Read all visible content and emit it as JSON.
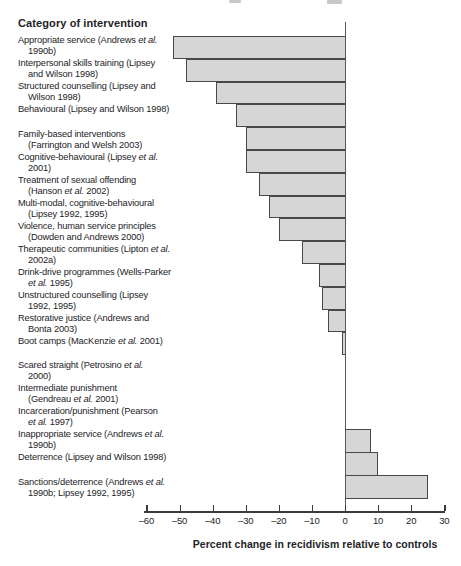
{
  "chart_data": {
    "type": "bar",
    "orientation": "horizontal",
    "title": "Category of intervention",
    "xlabel": "Percent change in recidivism relative to controls",
    "xlim": [
      -60,
      30
    ],
    "x_ticks": [
      -60,
      -50,
      -40,
      -30,
      -20,
      -10,
      0,
      10,
      20,
      30
    ],
    "x_tick_labels": [
      "–60",
      "–50",
      "–40",
      "–30",
      "–20",
      "–10",
      "0",
      "10",
      "20",
      "30"
    ],
    "bar_fill": "#d6d6d6",
    "bar_border": "#47474c",
    "items": [
      {
        "label": "Appropriate service (Andrews et al. 1990b)",
        "label_lines": [
          "Appropriate service (Andrews et al.",
          "1990b)"
        ],
        "value": -52,
        "group": 1,
        "gap_after": false
      },
      {
        "label": "Interpersonal skills training (Lipsey and Wilson 1998)",
        "label_lines": [
          "Interpersonal skills training (Lipsey",
          "and Wilson 1998)"
        ],
        "value": -48,
        "group": 1,
        "gap_after": false
      },
      {
        "label": "Structured counselling (Lipsey and Wilson 1998)",
        "label_lines": [
          "Structured counselling (Lipsey and",
          "Wilson 1998)"
        ],
        "value": -39,
        "group": 1,
        "gap_after": false
      },
      {
        "label": "Behavioural (Lipsey and Wilson 1998)",
        "label_lines": [
          "Behavioural (Lipsey and Wilson 1998)"
        ],
        "value": -33,
        "group": 1,
        "gap_after": true
      },
      {
        "label": "Family-based interventions (Farrington and Welsh 2003)",
        "label_lines": [
          "Family-based interventions",
          "(Farrington and Welsh 2003)"
        ],
        "value": -30,
        "group": 1,
        "gap_after": false
      },
      {
        "label": "Cognitive-behavioural (Lipsey et al. 2001)",
        "label_lines": [
          "Cognitive-behavioural (Lipsey et al.",
          "2001)"
        ],
        "value": -30,
        "group": 1,
        "gap_after": false
      },
      {
        "label": "Treatment of sexual offending (Hanson et al. 2002)",
        "label_lines": [
          "Treatment of sexual offending",
          "(Hanson et al. 2002)"
        ],
        "value": -26,
        "group": 1,
        "gap_after": false
      },
      {
        "label": "Multi-modal, cognitive-behavioural (Lipsey 1992, 1995)",
        "label_lines": [
          "Multi-modal, cognitive-behavioural",
          "(Lipsey 1992, 1995)"
        ],
        "value": -23,
        "group": 1,
        "gap_after": false
      },
      {
        "label": "Violence, human service principles (Dowden and Andrews 2000)",
        "label_lines": [
          "Violence, human service principles",
          "(Dowden and Andrews 2000)"
        ],
        "value": -20,
        "group": 1,
        "gap_after": false
      },
      {
        "label": "Therapeutic communities (Lipton et al. 2002a)",
        "label_lines": [
          "Therapeutic communities (Lipton et al.",
          "2002a)"
        ],
        "value": -13,
        "group": 1,
        "gap_after": false
      },
      {
        "label": "Drink-drive programmes (Wells-Parker et al. 1995)",
        "label_lines": [
          "Drink-drive programmes (Wells-Parker",
          "et al. 1995)"
        ],
        "value": -8,
        "group": 1,
        "gap_after": false
      },
      {
        "label": "Unstructured counselling (Lipsey 1992, 1995)",
        "label_lines": [
          "Unstructured counselling (Lipsey",
          "1992, 1995)"
        ],
        "value": -7,
        "group": 1,
        "gap_after": false
      },
      {
        "label": "Restorative justice (Andrews and Bonta 2003)",
        "label_lines": [
          "Restorative justice (Andrews and",
          "Bonta 2003)"
        ],
        "value": -5,
        "group": 1,
        "gap_after": false
      },
      {
        "label": "Boot camps (MacKenzie et al. 2001)",
        "label_lines": [
          "Boot camps (MacKenzie et al. 2001)"
        ],
        "value": -1,
        "group": 1,
        "gap_after": true
      },
      {
        "label": "Scared straight (Petrosino et al. 2000)",
        "label_lines": [
          "Scared straight (Petrosino et al.",
          "2000)"
        ],
        "value": 0,
        "group": 2,
        "gap_after": false
      },
      {
        "label": "Intermediate punishment (Gendreau et al. 2001)",
        "label_lines": [
          "Intermediate punishment",
          "(Gendreau et al. 2001)"
        ],
        "value": 0,
        "group": 2,
        "gap_after": false
      },
      {
        "label": "Incarceration/punishment (Pearson et al. 1997)",
        "label_lines": [
          "Incarceration/punishment (Pearson",
          "et al. 1997)"
        ],
        "value": 0,
        "group": 2,
        "gap_after": false
      },
      {
        "label": "Inappropriate service (Andrews et al. 1990b)",
        "label_lines": [
          "Inappropriate service (Andrews et al.",
          "1990b)"
        ],
        "value": 8,
        "group": 3,
        "gap_after": false
      },
      {
        "label": "Deterrence (Lipsey and Wilson 1998)",
        "label_lines": [
          "Deterrence (Lipsey and Wilson 1998)"
        ],
        "value": 10,
        "group": 3,
        "gap_after": true
      },
      {
        "label": "Sanctions/deterrence (Andrews et al. 1990b; Lipsey 1992, 1995)",
        "label_lines": [
          "Sanctions/deterrence (Andrews et al.",
          "1990b; Lipsey 1992, 1995)"
        ],
        "value": 25,
        "group": 3,
        "gap_after": false
      }
    ]
  }
}
